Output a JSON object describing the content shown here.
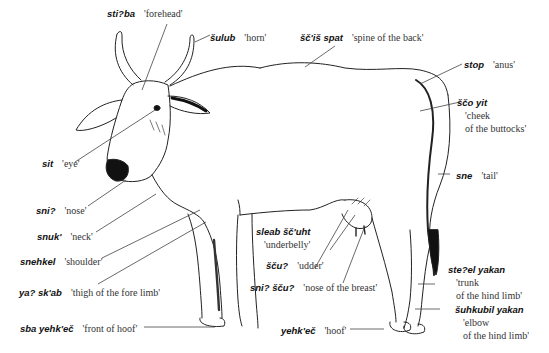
{
  "figure": {
    "labels": [
      {
        "id": "forehead",
        "term": "sti?ba",
        "gloss": "'forehead'"
      },
      {
        "id": "horn",
        "term": "šulub",
        "gloss": "'horn'"
      },
      {
        "id": "spine",
        "term": "šč'iš spat",
        "gloss": "'spine of the back'"
      },
      {
        "id": "anus",
        "term": "stop",
        "gloss": "'anus'"
      },
      {
        "id": "buttocks",
        "term": "ščo yit",
        "gloss_lines": [
          "'cheek",
          "of the buttocks'"
        ]
      },
      {
        "id": "eye",
        "term": "sit",
        "gloss": "'eye'"
      },
      {
        "id": "tail",
        "term": "sne",
        "gloss": "'tail'"
      },
      {
        "id": "nose",
        "term": "sni?",
        "gloss": "'nose'"
      },
      {
        "id": "neck",
        "term": "snuk'",
        "gloss": "'neck'"
      },
      {
        "id": "underbelly",
        "term": "sleab šč'uht",
        "gloss": "'underbelly'"
      },
      {
        "id": "shoulder",
        "term": "snehkel",
        "gloss": "'shoulder'"
      },
      {
        "id": "udder",
        "term": "šču?",
        "gloss": "'udder'"
      },
      {
        "id": "thigh-fore",
        "term": "ya? sk'ab",
        "gloss": "'thigh of the fore limb'"
      },
      {
        "id": "nose-breast",
        "term": "sni? šču?",
        "gloss": "'nose of the breast'"
      },
      {
        "id": "trunk-hind",
        "term": "ste?el yakan",
        "gloss_lines": [
          "'trunk",
          "of the hind limb'"
        ]
      },
      {
        "id": "front-hoof",
        "term": "sba yehk'eč",
        "gloss": "'front of hoof'"
      },
      {
        "id": "hoof",
        "term": "yehk'eč",
        "gloss": "'hoof'"
      },
      {
        "id": "elbow-hind",
        "term": "šuhkubil yakan",
        "gloss_lines": [
          "'elbow",
          "of the hind limb'"
        ]
      }
    ]
  },
  "colors": {
    "ink": "#111111",
    "gloss": "#333333",
    "leader": "#444444"
  }
}
